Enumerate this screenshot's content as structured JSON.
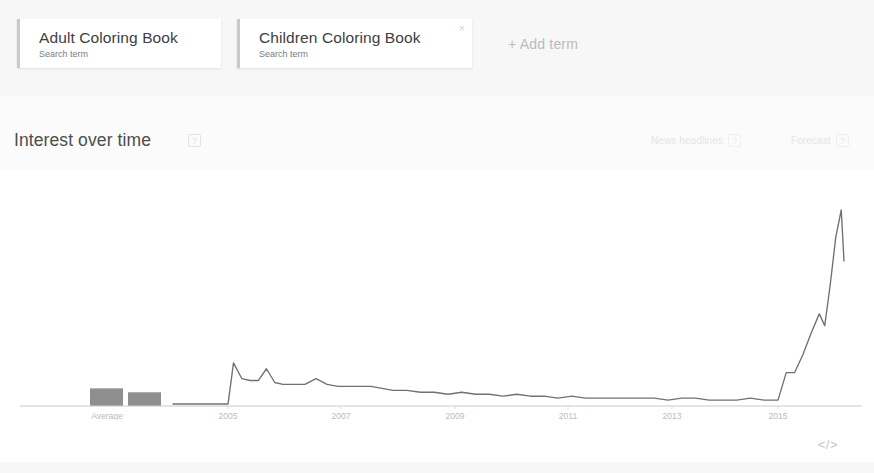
{
  "terms_bar": {
    "terms": [
      {
        "title": "Adult Coloring Book",
        "subtitle": "Search term",
        "remove_icon": "close-icon",
        "remove_glyph": ""
      },
      {
        "title": "Children Coloring Book",
        "subtitle": "Search term",
        "remove_icon": "close-icon",
        "remove_glyph": "×"
      }
    ],
    "add_term_label": "+ Add term"
  },
  "section": {
    "title": "Interest over time",
    "info_glyph": "?",
    "actions": [
      {
        "label": "News headlines",
        "info_glyph": "?"
      },
      {
        "label": "Forecast",
        "info_glyph": "?"
      }
    ]
  },
  "footer": {
    "embed_label": "</>"
  },
  "colors": {
    "page_background": "#fbfbfb",
    "terms_bar_background": "#f7f7f7",
    "card_background": "#ffffff",
    "card_accent": "#c9c9c9",
    "title_text": "#3c4043",
    "muted_text": "#7a7d80",
    "faint_text": "#e4e5e6",
    "chart_line": "#6f7173",
    "axis_line": "#c8cacb",
    "average_bar": "#8d8f91"
  },
  "chart_data": {
    "type": "line",
    "title": "Interest over time",
    "xlabel": "",
    "ylabel": "",
    "ylim": [
      0,
      100
    ],
    "grid": false,
    "legend": null,
    "axis_tick_labels": [
      "2005",
      "2007",
      "2009",
      "2011",
      "2013",
      "2015"
    ],
    "axis_tick_x_px": [
      228,
      341,
      455,
      568,
      672,
      778
    ],
    "average_label": "Average",
    "average_bars": [
      {
        "series": "Adult Coloring Book",
        "value": 9
      },
      {
        "series": "Children Coloring Book",
        "value": 7
      }
    ],
    "series": [
      {
        "name": "Adult Coloring Book",
        "color": "#6f7173",
        "x": [
          2004.0,
          2004.25,
          2004.5,
          2004.75,
          2005.0,
          2005.1,
          2005.25,
          2005.4,
          2005.55,
          2005.7,
          2005.85,
          2006.0,
          2006.2,
          2006.4,
          2006.6,
          2006.8,
          2007.0,
          2007.2,
          2007.4,
          2007.6,
          2007.8,
          2008.0,
          2008.25,
          2008.5,
          2008.75,
          2009.0,
          2009.25,
          2009.5,
          2009.75,
          2010.0,
          2010.25,
          2010.5,
          2010.75,
          2011.0,
          2011.25,
          2011.5,
          2011.75,
          2012.0,
          2012.25,
          2012.5,
          2012.75,
          2013.0,
          2013.25,
          2013.5,
          2013.75,
          2014.0,
          2014.25,
          2014.5,
          2014.75,
          2015.0,
          2015.15,
          2015.3,
          2015.45,
          2015.6,
          2015.75,
          2015.85,
          2015.95,
          2016.05,
          2016.15,
          2016.2
        ],
        "values": [
          1,
          1,
          1,
          1,
          1,
          22,
          14,
          13,
          13,
          19,
          12,
          11,
          11,
          11,
          14,
          11,
          10,
          10,
          10,
          10,
          9,
          8,
          8,
          7,
          7,
          6,
          7,
          6,
          6,
          5,
          6,
          5,
          5,
          4,
          5,
          4,
          4,
          4,
          4,
          4,
          4,
          3,
          4,
          4,
          3,
          3,
          3,
          4,
          3,
          3,
          17,
          17,
          26,
          37,
          47,
          41,
          62,
          86,
          100,
          74
        ]
      }
    ]
  }
}
